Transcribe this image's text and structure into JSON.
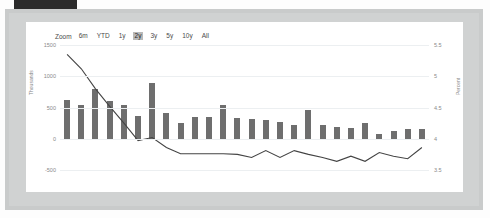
{
  "window": {
    "title_faded": ""
  },
  "zoom_selector": {
    "label": "Zoom",
    "options": [
      "6m",
      "YTD",
      "1y",
      "2y",
      "3y",
      "5y",
      "10y",
      "All"
    ],
    "selected": "2y"
  },
  "colors": {
    "bar": "#6e6e6e",
    "line": "#444444",
    "grid": "#eceff1",
    "frame": "#c9cbcb",
    "panel": "#ffffff",
    "topbar": "#2b2b2b",
    "active_button_bg": "#b9b9b9"
  },
  "chart_data": {
    "type": "bar",
    "title": "",
    "xlabel": "",
    "ylabel": "Thousands",
    "y2label": "Percent",
    "grid": true,
    "legend": "none",
    "ylim": [
      -500,
      1500
    ],
    "y2lim": [
      3.5,
      5.5
    ],
    "yticks": [
      "1500",
      "1000",
      "500",
      "0",
      "-500"
    ],
    "ytick_values": [
      1500,
      1000,
      500,
      0,
      -500
    ],
    "y2ticks": [
      "5.5",
      "5",
      "4.5",
      "4",
      "3.5"
    ],
    "y2tick_values": [
      5.5,
      5,
      4.5,
      4,
      3.5
    ],
    "categories": [
      "1",
      "2",
      "3",
      "4",
      "5",
      "6",
      "7",
      "8",
      "9",
      "10",
      "11",
      "12",
      "13",
      "14",
      "15",
      "16",
      "17",
      "18",
      "19",
      "20",
      "21",
      "22",
      "23",
      "24",
      "25",
      "26"
    ],
    "series": [
      {
        "name": "Volume",
        "type": "bar",
        "axis": "left",
        "values": [
          620,
          545,
          790,
          605,
          545,
          360,
          900,
          410,
          255,
          350,
          355,
          545,
          340,
          320,
          295,
          270,
          215,
          460,
          225,
          185,
          175,
          245,
          80,
          130,
          155,
          155
        ]
      },
      {
        "name": "Rate",
        "type": "line",
        "axis": "right",
        "values": [
          5.35,
          5.12,
          4.8,
          4.52,
          4.25,
          3.97,
          4.02,
          3.86,
          3.76,
          3.76,
          3.76,
          3.76,
          3.75,
          3.7,
          3.81,
          3.7,
          3.81,
          3.75,
          3.7,
          3.64,
          3.72,
          3.64,
          3.78,
          3.72,
          3.68,
          3.86
        ]
      }
    ]
  }
}
